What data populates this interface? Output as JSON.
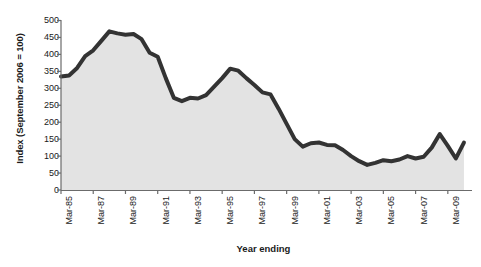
{
  "chart_data": {
    "type": "area",
    "title": "",
    "xlabel": "Year ending",
    "ylabel": "Index (September 2006 = 100)",
    "ylim": [
      0,
      500
    ],
    "ytick_values": [
      0,
      50,
      100,
      150,
      200,
      250,
      300,
      350,
      400,
      450,
      500
    ],
    "ytick_labels": [
      "0",
      "50",
      "100",
      "150",
      "200",
      "250",
      "300",
      "350",
      "400",
      "450",
      "500"
    ],
    "xtick_labels": [
      "Mar-85",
      "Mar-87",
      "Mar-89",
      "Mar-91",
      "Mar-93",
      "Mar-95",
      "Mar-97",
      "Mar-99",
      "Mar-01",
      "Mar-03",
      "Mar-05",
      "Mar-07",
      "Mar-09"
    ],
    "xtick_years": [
      1985,
      1987,
      1989,
      1991,
      1993,
      1995,
      1997,
      1999,
      2001,
      2003,
      2005,
      2007,
      2009
    ],
    "xlim": [
      1985,
      2010.5
    ],
    "grid": false,
    "legend": false,
    "series": [
      {
        "name": "Index (September 2006 = 100)",
        "line_color": "#333333",
        "fill_color": "#e3e3e3",
        "line_width": 4,
        "x": [
          1985.0,
          1985.5,
          1986.0,
          1986.5,
          1987.0,
          1987.5,
          1988.0,
          1988.5,
          1989.0,
          1989.5,
          1990.0,
          1990.5,
          1991.0,
          1991.5,
          1992.0,
          1992.5,
          1993.0,
          1993.5,
          1994.0,
          1994.5,
          1995.0,
          1995.5,
          1996.0,
          1996.5,
          1997.0,
          1997.5,
          1998.0,
          1998.5,
          1999.0,
          1999.5,
          2000.0,
          2000.5,
          2001.0,
          2001.5,
          2002.0,
          2002.5,
          2003.0,
          2003.5,
          2004.0,
          2004.5,
          2005.0,
          2005.5,
          2006.0,
          2006.5,
          2007.0,
          2007.5,
          2008.0,
          2008.5,
          2009.0,
          2009.5,
          2010.0
        ],
        "y": [
          335,
          338,
          360,
          395,
          412,
          440,
          468,
          462,
          458,
          460,
          445,
          405,
          393,
          330,
          272,
          262,
          272,
          270,
          280,
          305,
          330,
          358,
          352,
          330,
          310,
          288,
          282,
          240,
          195,
          150,
          128,
          138,
          140,
          133,
          132,
          118,
          100,
          85,
          74,
          80,
          88,
          85,
          90,
          100,
          93,
          98,
          125,
          165,
          130,
          93,
          140
        ]
      }
    ]
  }
}
